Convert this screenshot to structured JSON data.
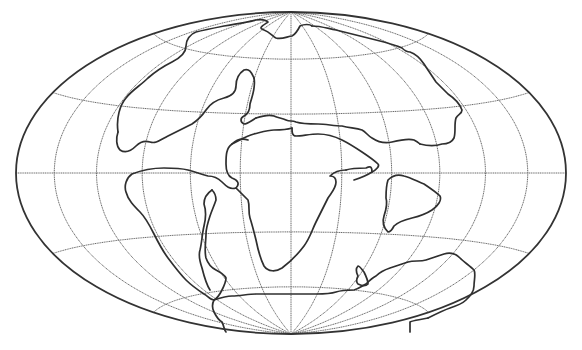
{
  "map": {
    "type": "paleogeographic world map (Pangea)",
    "projection": "hammer",
    "background": "#ffffff",
    "line_color": "#333333",
    "graticule_color": "#6a6a6a",
    "ellipse": {
      "cx": 291,
      "cy": 173,
      "rx": 275,
      "ry": 161
    },
    "graticule": {
      "meridian_step_deg": 30,
      "parallels_deg": [
        -60,
        -30,
        0,
        30,
        60
      ]
    },
    "landmasses": [
      {
        "name": "north-america-laurasia-west",
        "path": "M 118 132 C 116 118 120 105 126 98 C 132 90 140 86 148 78 C 156 71 164 66 172 62 C 180 58 186 52 186 46 C 186 40 190 34 196 32 C 204 30 214 28 224 26 C 236 24 248 22 256 20 C 262 19 266 20 268 22 C 262 26 258 28 264 30 C 270 32 272 36 276 38 C 282 40 288 36 292 36 C 296 34 298 30 300 26 C 304 24 310 24 312 26"
      },
      {
        "name": "north-america-south-coast",
        "path": "M 118 132 C 116 138 116 146 120 150 C 126 154 132 150 136 146 C 140 142 144 140 150 142 C 156 144 160 140 168 136 C 176 132 184 128 192 124 C 198 120 202 116 206 110 C 210 104 216 100 224 98 C 232 96 236 92 236 86 C 236 80 238 74 244 70 C 250 68 252 74 254 78"
      },
      {
        "name": "laurentia-interior",
        "path": "M 254 78 C 256 88 252 96 250 104 C 250 110 248 114 244 116 C 240 118 240 122 244 124 C 248 124 252 120 256 118"
      },
      {
        "name": "eurasia-north",
        "path": "M 312 26 C 320 26 326 28 336 30 C 344 32 352 34 360 36 C 368 38 376 40 384 42 C 390 44 398 46 402 48 C 404 50 406 52 410 52 C 416 54 420 58 424 64 C 428 70 432 76 436 82 C 440 86 444 90 448 94 C 454 98 460 104 462 110 C 462 114 458 114 456 118 C 454 124 456 132 454 138 C 452 142 448 144 442 144 C 436 146 428 146 420 144"
      },
      {
        "name": "tethys-north-shore",
        "path": "M 256 118 C 262 116 268 114 274 116 C 278 118 282 118 286 120 C 290 122 292 120 296 122 C 302 124 310 124 318 124 C 326 124 334 126 342 126 C 350 128 356 128 362 130 C 366 132 368 136 372 138 C 378 142 384 144 392 142 C 400 140 408 138 414 140 C 418 142 420 144 420 144"
      },
      {
        "name": "tethys-south-shore",
        "path": "M 292 128 C 292 132 292 136 296 136 C 302 136 310 134 318 134 C 326 134 334 136 342 140 C 350 144 356 148 362 152 C 368 156 374 160 378 164 C 380 166 376 170 372 172"
      },
      {
        "name": "africa-south-america",
        "path": "M 292 128 C 286 130 280 130 274 130 C 268 130 262 132 254 134 C 246 136 240 140 232 144 C 226 148 226 156 226 164 C 226 170 228 176 232 178 C 238 180 240 184 236 188 C 230 190 226 186 222 182 C 218 178 214 176 208 176 C 200 174 196 172 188 170 C 180 168 172 168 164 168 C 154 168 142 170 132 174 C 126 178 124 186 126 192 C 128 200 134 206 140 212 C 146 218 150 226 154 234 C 158 242 162 250 168 258 C 174 266 180 274 186 280 C 192 286 198 290 204 294 C 208 296 210 300 214 300 C 218 298 220 294 222 290 C 224 286 226 282 226 278 C 224 274 220 272 216 270 C 212 268 208 264 206 258 C 204 250 206 242 206 234 C 206 228 208 222 210 216 C 212 210 214 206 216 200 C 216 196 214 192 212 190"
      },
      {
        "name": "africa-east-coast",
        "path": "M 236 188 C 240 192 244 196 248 200 C 250 206 248 212 250 218 C 252 224 254 232 256 240 C 258 250 260 258 264 266 C 268 272 276 272 282 268 C 290 262 298 254 304 246 C 310 238 312 230 316 222 C 320 214 324 206 328 198 C 332 192 336 188 336 182 C 336 178 334 176 330 176 C 334 172 340 170 346 170"
      },
      {
        "name": "africa-north",
        "path": "M 346 170 C 352 168 360 168 366 168 C 370 166 372 166 372 172 M 372 172 C 366 176 360 178 354 180 M 232 144 C 236 140 242 138 248 140"
      },
      {
        "name": "south-america-east-gondwana-border",
        "path": "M 212 190 C 206 194 204 198 204 204 C 206 210 206 218 204 226 C 202 234 202 242 200 250 C 198 256 200 262 202 268 C 204 276 206 284 210 290"
      },
      {
        "name": "india-madagascar-block",
        "path": "M 388 232 C 384 228 382 222 384 216 C 386 210 388 204 386 198 C 386 192 386 186 388 180 C 392 176 398 174 404 176 C 412 178 418 182 424 184 C 430 188 436 192 440 196 C 442 200 438 206 432 210 C 426 214 420 216 412 218 C 404 220 398 222 394 226 C 392 230 390 232 388 232 Z"
      },
      {
        "name": "antarctica-australia-north-coast",
        "path": "M 214 300 C 220 298 226 296 232 296 C 240 296 248 294 256 294 C 266 294 276 294 286 294 C 296 294 306 294 316 294 C 324 294 330 294 336 292 C 342 290 348 290 354 290 C 360 288 362 286 366 284 C 370 280 372 278 376 276 C 380 272 384 270 390 268 C 396 266 402 264 408 262 C 414 260 420 262 426 260 C 432 258 438 256 444 254 C 450 252 456 254 460 258 C 464 262 470 266 474 270 C 476 274 474 280 474 286 C 474 292 470 296 466 300 C 462 304 456 306 450 308 C 444 310 436 314 428 318"
      },
      {
        "name": "antarctica-edge",
        "path": "M 428 318 C 420 320 414 320 410 322 C 410 326 410 330 410 332 M 214 300 C 212 304 212 308 214 312 C 216 316 218 320 222 322 C 224 326 224 330 226 332"
      },
      {
        "name": "small-island",
        "path": "M 358 276 C 356 272 356 268 358 266 C 360 266 362 270 364 272 C 366 276 368 280 368 284 C 366 286 362 286 358 284 C 356 282 356 280 358 276 Z"
      }
    ]
  }
}
